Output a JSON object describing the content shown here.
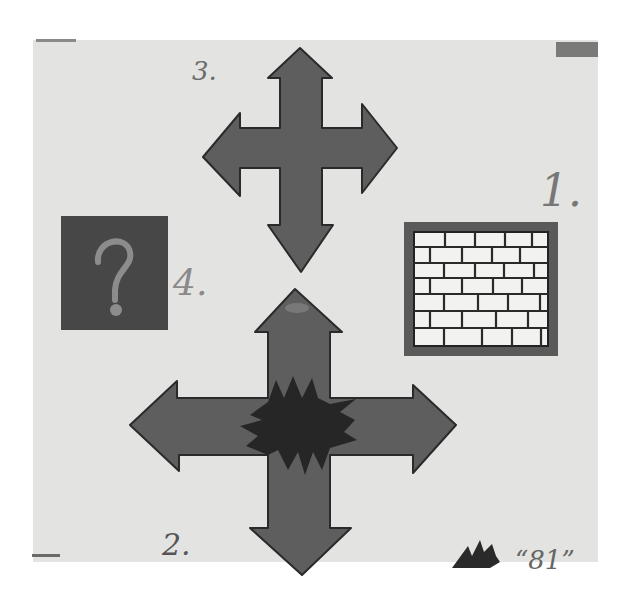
{
  "image": {
    "description": "Photograph of a hand-painted card with four numbered symbols on light paper",
    "colors": {
      "background": "#ffffff",
      "paper": "#e3e3e1",
      "arrow_fill": "#5e5e5e",
      "arrow_outline": "#2a2a2a",
      "burst_fill": "#262626",
      "question_box": "#474747",
      "question_mark": "#8c8c8c",
      "brick_frame": "#5a5a5a",
      "brick_fill": "#f2f2f0"
    }
  },
  "labels": {
    "item_1": "1.",
    "item_2": "2.",
    "item_3": "3.",
    "item_4": "4.",
    "signature": "“81”"
  },
  "symbols": [
    {
      "number": "1",
      "name": "brick-wall",
      "description": "Framed brick wall"
    },
    {
      "number": "2",
      "name": "four-way-arrow-burst",
      "description": "Four-direction arrow cross with jagged dark burst in the center"
    },
    {
      "number": "3",
      "name": "four-way-arrow",
      "description": "Four-direction arrow cross"
    },
    {
      "number": "4",
      "name": "question-box",
      "description": "Dark square with a question mark"
    }
  ]
}
